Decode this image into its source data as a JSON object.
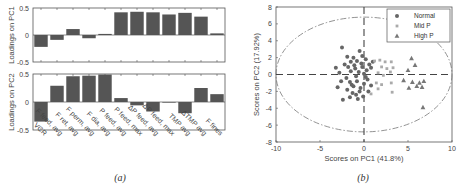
{
  "captions": {
    "a": "(a)",
    "b": "(b)"
  },
  "chart_data": [
    {
      "type": "bar",
      "panel": "a-top",
      "ylabel": "Loadings on PC1",
      "ylim": [
        -0.5,
        0.5
      ],
      "yticks": [
        "0.5",
        "0",
        "-0.5"
      ],
      "categories": [
        "VCR",
        "F feed, avg",
        "F ret, avg",
        "F perm, avg",
        "F dia, avg",
        "P feed, avg",
        "P feed, max",
        "ΔP feed, avg",
        "ΔP feed, max",
        "TMP avg",
        "ΔTMP avg",
        "F fines"
      ],
      "values": [
        -0.22,
        -0.09,
        0.11,
        -0.06,
        0.02,
        0.42,
        0.43,
        0.42,
        0.38,
        0.41,
        0.34,
        0.03
      ],
      "color": "#555555"
    },
    {
      "type": "bar",
      "panel": "a-bottom",
      "ylabel": "Loadings on PC2",
      "ylim": [
        -0.5,
        0.5
      ],
      "yticks": [
        "0.5",
        "0",
        "-0.5"
      ],
      "categories": [
        "VCR",
        "F feed, avg",
        "F ret, avg",
        "F perm, avg",
        "F dia, avg",
        "P feed, avg",
        "P feed, max",
        "ΔP feed, avg",
        "ΔP feed, max",
        "TMP avg",
        "ΔTMP avg",
        "F fines"
      ],
      "tick_labels": [
        "VCR",
        "F feed, avg",
        "F ret, avg",
        "F perm, avg",
        "F dia, avg",
        "P feed, avg",
        "P feed, max",
        "ΔP feed, avg",
        "ΔP feed, max",
        "TMP avg",
        "ΔTMP avg",
        "F fines"
      ],
      "values": [
        -0.35,
        0.29,
        0.46,
        0.47,
        0.49,
        0.07,
        -0.06,
        -0.17,
        -0.01,
        -0.2,
        0.25,
        0.14
      ],
      "color": "#555555"
    },
    {
      "type": "scatter",
      "panel": "b",
      "xlabel": "Scores on PC1 (41.8%)",
      "ylabel": "Scores on PC2 (17.92%)",
      "xlim": [
        -10,
        10
      ],
      "ylim": [
        -8,
        8
      ],
      "xticks": [
        "-10",
        "-5",
        "0",
        "5",
        "10"
      ],
      "yticks": [
        "8",
        "6",
        "4",
        "2",
        "0",
        "-2",
        "-4",
        "-6",
        "-8"
      ],
      "legend": [
        "Normal",
        "Mid P",
        "High P"
      ],
      "legend_position": "upper right",
      "series": [
        {
          "name": "Normal",
          "marker": "circle",
          "color": "#666666",
          "points": [
            [
              -2.5,
              3.2
            ],
            [
              -3.2,
              0.8
            ],
            [
              -2.8,
              0.2
            ],
            [
              -3.0,
              -1.5
            ],
            [
              -2.4,
              -3.0
            ],
            [
              -1.5,
              1.5
            ],
            [
              -1.2,
              2.0
            ],
            [
              -0.8,
              1.6
            ],
            [
              -0.5,
              2.8
            ],
            [
              -0.2,
              2.2
            ],
            [
              0.2,
              1.8
            ],
            [
              0.6,
              1.2
            ],
            [
              1.0,
              1.5
            ],
            [
              -1.8,
              0.9
            ],
            [
              -1.5,
              0.4
            ],
            [
              -1.0,
              0.7
            ],
            [
              -0.6,
              0.3
            ],
            [
              -0.2,
              0.9
            ],
            [
              0.3,
              0.5
            ],
            [
              0.8,
              0.8
            ],
            [
              -2.0,
              -0.4
            ],
            [
              -1.6,
              -0.9
            ],
            [
              -1.2,
              -1.4
            ],
            [
              -0.8,
              -0.8
            ],
            [
              -0.4,
              -1.6
            ],
            [
              0.0,
              -1.1
            ],
            [
              0.4,
              -0.6
            ],
            [
              0.8,
              -1.3
            ],
            [
              -1.9,
              -1.8
            ],
            [
              -1.3,
              -2.2
            ],
            [
              -0.9,
              -2.4
            ],
            [
              -0.5,
              -2.0
            ],
            [
              -0.1,
              -2.6
            ],
            [
              0.5,
              -2.0
            ],
            [
              -1.6,
              -2.7
            ],
            [
              -0.7,
              -2.9
            ],
            [
              -2.2,
              1.2
            ],
            [
              -1.9,
              2.1
            ],
            [
              -0.3,
              1.3
            ],
            [
              0.0,
              0.1
            ],
            [
              0.2,
              -0.3
            ],
            [
              -1.1,
              1.1
            ],
            [
              -0.9,
              -0.2
            ],
            [
              -2.6,
              -0.8
            ],
            [
              -1.4,
              -1.2
            ]
          ]
        },
        {
          "name": "Mid P",
          "marker": "square",
          "color": "#aaaaaa",
          "points": [
            [
              1.2,
              1.6
            ],
            [
              1.8,
              1.7
            ],
            [
              2.4,
              1.5
            ],
            [
              3.1,
              1.5
            ],
            [
              2.0,
              0.9
            ],
            [
              2.6,
              0.7
            ],
            [
              3.3,
              0.8
            ],
            [
              1.6,
              0.2
            ],
            [
              2.2,
              -0.1
            ],
            [
              3.0,
              0.3
            ],
            [
              1.4,
              -1.0
            ],
            [
              2.0,
              -1.2
            ],
            [
              3.1,
              -1.0
            ],
            [
              1.6,
              -1.7
            ],
            [
              3.2,
              -2.1
            ],
            [
              0.8,
              -2.3
            ]
          ]
        },
        {
          "name": "High P",
          "marker": "triangle",
          "color": "#777777",
          "points": [
            [
              5.4,
              1.9
            ],
            [
              5.8,
              1.1
            ],
            [
              5.0,
              0.5
            ],
            [
              4.5,
              -0.7
            ],
            [
              5.5,
              -0.9
            ],
            [
              6.3,
              -1.0
            ],
            [
              6.8,
              -0.8
            ],
            [
              5.1,
              -1.6
            ],
            [
              6.0,
              -1.4
            ],
            [
              6.6,
              -1.5
            ],
            [
              6.7,
              -3.9
            ]
          ]
        }
      ],
      "confidence_ellipse": {
        "cx": 0,
        "cy": 0,
        "rx": 10,
        "ry": 6.8,
        "style": "dash-dot"
      },
      "reference_lines": {
        "x0": "dashed",
        "y0": "dashed"
      }
    }
  ]
}
